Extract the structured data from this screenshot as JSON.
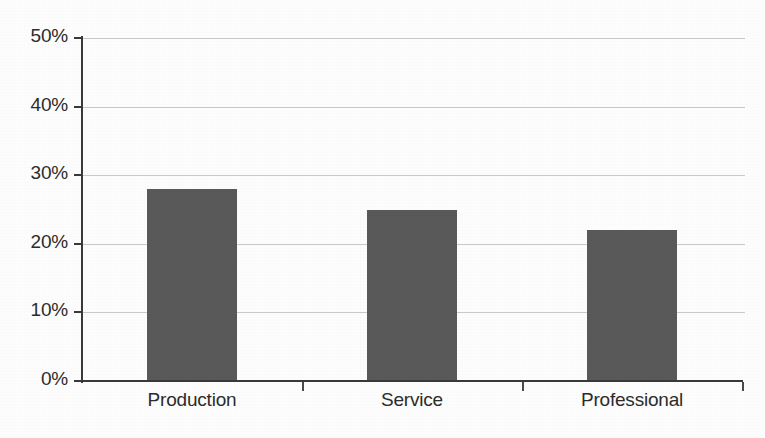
{
  "chart_data": {
    "type": "bar",
    "title": "",
    "subtitle": "",
    "xlabel": "",
    "ylabel": "",
    "categories": [
      "Production",
      "Service",
      "Professional"
    ],
    "values": [
      28,
      25,
      22
    ],
    "value_suffix": "%",
    "ylim": [
      0,
      50
    ],
    "ytick_values": [
      0,
      10,
      20,
      30,
      40,
      50
    ],
    "ytick_labels": [
      "0%",
      "10%",
      "20%",
      "30%",
      "40%",
      "50%"
    ],
    "grid": true,
    "grid_axis": "y",
    "legend": false,
    "legend_position": "none",
    "series": [
      {
        "name": "",
        "values": [
          28,
          25,
          22
        ],
        "color": "#595959"
      }
    ],
    "colors": {
      "bar_fill": "#595959",
      "axis_line": "#3a3a3a",
      "gridline": "#c9c9c9",
      "text": "#2c2c2c",
      "background": "#fdfdfd"
    }
  }
}
